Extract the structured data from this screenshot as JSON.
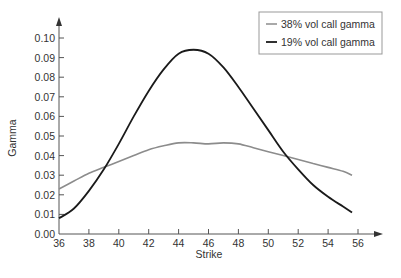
{
  "chart_data": {
    "type": "line",
    "title": "",
    "xlabel": "Strike",
    "ylabel": "Gamma",
    "xlim": [
      36,
      57
    ],
    "ylim": [
      0.0,
      0.105
    ],
    "xticks": [
      36,
      38,
      40,
      42,
      44,
      46,
      48,
      50,
      52,
      54,
      56
    ],
    "xtick_labels": [
      "36",
      "38",
      "40",
      "42",
      "44",
      "46",
      "48",
      "50",
      "52",
      "54",
      "56"
    ],
    "yticks": [
      0.0,
      0.01,
      0.02,
      0.03,
      0.04,
      0.05,
      0.06,
      0.07,
      0.08,
      0.09,
      0.1
    ],
    "ytick_labels": [
      "0.00",
      "0.01",
      "0.02",
      "0.03",
      "0.04",
      "0.05",
      "0.06",
      "0.07",
      "0.08",
      "0.09",
      "0.10"
    ],
    "grid": false,
    "legend_position": "upper right",
    "series": [
      {
        "name": "38% vol call gamma",
        "color": "#8c8c8c",
        "x": [
          36,
          37,
          38,
          39,
          40,
          41,
          42,
          43,
          44,
          45,
          46,
          47,
          48,
          49,
          50,
          51,
          52,
          53,
          54,
          55,
          55.6
        ],
        "y": [
          0.023,
          0.027,
          0.031,
          0.034,
          0.037,
          0.04,
          0.043,
          0.045,
          0.0465,
          0.0465,
          0.046,
          0.0465,
          0.046,
          0.044,
          0.042,
          0.04,
          0.038,
          0.036,
          0.034,
          0.032,
          0.03
        ]
      },
      {
        "name": "19% vol call gamma",
        "color": "#1a1a1a",
        "x": [
          36,
          37,
          38,
          39,
          40,
          41,
          42,
          43,
          44,
          45,
          46,
          47,
          48,
          49,
          50,
          51,
          52,
          53,
          54,
          55,
          55.6
        ],
        "y": [
          0.008,
          0.013,
          0.022,
          0.033,
          0.046,
          0.06,
          0.073,
          0.084,
          0.092,
          0.094,
          0.092,
          0.085,
          0.075,
          0.064,
          0.053,
          0.042,
          0.033,
          0.025,
          0.019,
          0.014,
          0.011
        ]
      }
    ]
  },
  "legend": {
    "items": [
      {
        "label": "38% vol call gamma",
        "color": "#8c8c8c"
      },
      {
        "label": "19% vol call gamma",
        "color": "#1a1a1a"
      }
    ]
  },
  "axes": {
    "x_title": "Strike",
    "y_title": "Gamma"
  }
}
